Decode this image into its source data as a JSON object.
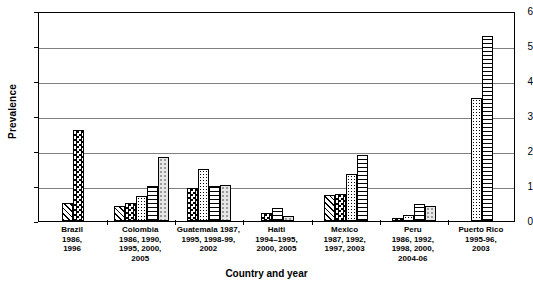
{
  "chart_data": {
    "type": "bar",
    "title": "",
    "xlabel": "Country and year",
    "ylabel": "Prevalence",
    "ylim": [
      0,
      6
    ],
    "yticks": [
      0,
      1,
      2,
      3,
      4,
      5,
      6
    ],
    "grid": true,
    "legend": "none",
    "categories": [
      "Brazil 1986, 1996",
      "Colombia 1986, 1990, 1995, 2000, 2005",
      "Guatemala 1987, 1995, 1998-99, 2002",
      "Haiti 1994–1995, 2000, 2005",
      "Mexico 1987, 1992, 1997, 2003",
      "Peru 1986, 1992, 1998, 2000, 2004-06",
      "Puerto Rico 1995-96, 2003"
    ],
    "groups": [
      {
        "name": "Brazil",
        "label_lines": [
          "Brazil",
          "1986,",
          "1996"
        ],
        "bars": [
          {
            "value": 0.52,
            "pattern": "diagonal-hatch"
          },
          {
            "value": 2.6,
            "pattern": "checkerboard"
          }
        ]
      },
      {
        "name": "Colombia",
        "label_lines": [
          "Colombia",
          "1986, 1990,",
          "1995, 2000,",
          "2005"
        ],
        "bars": [
          {
            "value": 0.42,
            "pattern": "diagonal-hatch"
          },
          {
            "value": 0.52,
            "pattern": "checkerboard"
          },
          {
            "value": 0.72,
            "pattern": "dense-dots"
          },
          {
            "value": 1.0,
            "pattern": "horizontal-lines"
          },
          {
            "value": 1.82,
            "pattern": "light-dots"
          }
        ]
      },
      {
        "name": "Guatemala",
        "label_lines": [
          "Guatemala 1987,",
          "1995, 1998-99,",
          "2002"
        ],
        "bars": [
          {
            "value": 0.95,
            "pattern": "checkerboard"
          },
          {
            "value": 1.5,
            "pattern": "dense-dots"
          },
          {
            "value": 1.0,
            "pattern": "horizontal-lines"
          },
          {
            "value": 1.02,
            "pattern": "light-dots"
          }
        ]
      },
      {
        "name": "Haiti",
        "label_lines": [
          "Haiti",
          "1994–1995,",
          "2000, 2005"
        ],
        "bars": [
          {
            "value": 0.24,
            "pattern": "checkerboard"
          },
          {
            "value": 0.38,
            "pattern": "horizontal-lines"
          },
          {
            "value": 0.13,
            "pattern": "light-dots"
          }
        ]
      },
      {
        "name": "Mexico",
        "label_lines": [
          "Mexico",
          "1987, 1992,",
          "1997, 2003"
        ],
        "bars": [
          {
            "value": 0.75,
            "pattern": "diagonal-hatch"
          },
          {
            "value": 0.78,
            "pattern": "checkerboard"
          },
          {
            "value": 1.35,
            "pattern": "dense-dots"
          },
          {
            "value": 1.9,
            "pattern": "horizontal-lines"
          }
        ]
      },
      {
        "name": "Peru",
        "label_lines": [
          "Peru",
          "1986, 1992,",
          "1998, 2000,",
          "2004-06"
        ],
        "bars": [
          {
            "value": 0.1,
            "pattern": "checkerboard"
          },
          {
            "value": 0.18,
            "pattern": "dense-dots"
          },
          {
            "value": 0.5,
            "pattern": "horizontal-lines"
          },
          {
            "value": 0.42,
            "pattern": "light-dots"
          }
        ]
      },
      {
        "name": "Puerto Rico",
        "label_lines": [
          "Puerto Rico",
          "1995-96,",
          "2003"
        ],
        "bars": [
          {
            "value": 3.52,
            "pattern": "dense-dots"
          },
          {
            "value": 5.3,
            "pattern": "horizontal-lines"
          }
        ]
      }
    ]
  },
  "axes": {
    "y_title": "Prevalence",
    "x_title": "Country and year",
    "y_tick_labels": [
      "0",
      "1",
      "2",
      "3",
      "4",
      "5",
      "6"
    ]
  }
}
